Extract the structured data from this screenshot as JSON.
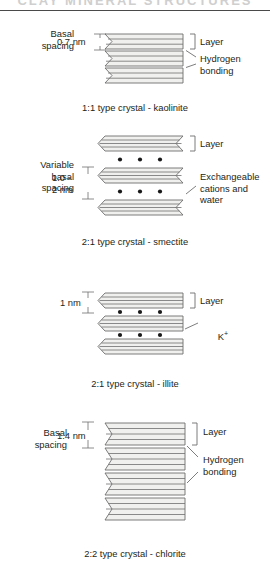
{
  "page": {
    "header_ghost_text": "CLAY MINERAL STRUCTURES",
    "background": "#ffffff",
    "ink": "#231f20",
    "layer_fill": "#f0f0ee",
    "line_color": "#6e6e6e"
  },
  "sections": [
    {
      "id": "kaolinite",
      "caption": "1:1 type crystal - kaolinite",
      "left_label": "Basal\nspacing",
      "dimension_label": "0.7 nm",
      "right_labels": [
        "Layer",
        "Hydrogen\nbonding"
      ],
      "layers": 3,
      "lines_per_layer": 2,
      "has_dots": false,
      "dot_label": ""
    },
    {
      "id": "smectite",
      "caption": "2:1 type crystal - smectite",
      "left_label": "Variable\nbasal\nspacing",
      "dimension_label": "1.0 -\n2 nm",
      "right_labels": [
        "Layer",
        "Exchangeable\ncations and\nwater"
      ],
      "layers": 3,
      "lines_per_layer": 3,
      "has_dots": true,
      "dots_per_row": 3,
      "dot_label": "Exchangeable cations and water"
    },
    {
      "id": "illite",
      "caption": "2:1 type crystal - illite",
      "left_label": "",
      "dimension_label": "1 nm",
      "right_labels": [
        "Layer",
        "K+"
      ],
      "layers": 3,
      "lines_per_layer": 3,
      "has_dots": true,
      "dots_per_row": 3,
      "dot_label": "K+"
    },
    {
      "id": "chlorite",
      "caption": "2:2 type crystal - chlorite",
      "left_label": "Basal\nspacing",
      "dimension_label": "1.4 nm",
      "right_labels": [
        "Layer",
        "Hydrogen\nbonding"
      ],
      "layers": 4,
      "lines_per_layer": 4,
      "has_dots": false,
      "dot_label": ""
    }
  ],
  "labels": {
    "basal_spacing": "Basal\nspacing",
    "variable_basal_spacing": "Variable\nbasal\nspacing",
    "layer": "Layer",
    "hydrogen_bonding": "Hydrogen\nbonding",
    "exchangeable": "Exchangeable\ncations and\nwater",
    "potassium_symbol": "K",
    "potassium_charge": "+",
    "nm_07": "0.7 nm",
    "nm_10_2": "1.0 -\n2 nm",
    "nm_1": "1 nm",
    "nm_14": "1.4 nm"
  },
  "captions": {
    "kaolinite": "1:1 type crystal - kaolinite",
    "smectite": "2:1 type crystal - smectite",
    "illite": "2:1 type crystal - illite",
    "chlorite": "2:2 type crystal - chlorite"
  }
}
